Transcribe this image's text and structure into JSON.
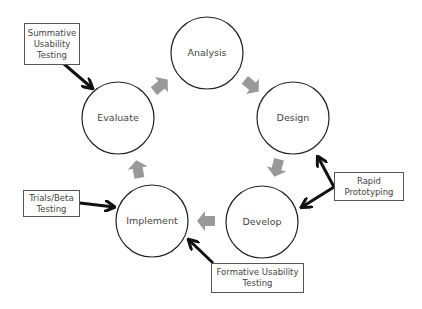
{
  "diagram": {
    "type": "cycle",
    "nodes": [
      {
        "id": "analysis",
        "label": "Analysis"
      },
      {
        "id": "design",
        "label": "Design"
      },
      {
        "id": "develop",
        "label": "Develop"
      },
      {
        "id": "implement",
        "label": "Implement"
      },
      {
        "id": "evaluate",
        "label": "Evaluate"
      }
    ],
    "cycle_order": [
      "Analysis",
      "Design",
      "Develop",
      "Implement",
      "Evaluate"
    ],
    "annotations": [
      {
        "id": "summative",
        "lines": [
          "Summative",
          "Usability",
          "Testing"
        ],
        "points_to": [
          "Evaluate"
        ]
      },
      {
        "id": "trials",
        "lines": [
          "Trials/Beta",
          "Testing"
        ],
        "points_to": [
          "Implement"
        ]
      },
      {
        "id": "rapid",
        "lines": [
          "Rapid",
          "Prototyping"
        ],
        "points_to": [
          "Design",
          "Develop"
        ]
      },
      {
        "id": "formative",
        "lines": [
          "Formative Usability",
          "Testing"
        ],
        "points_to": [
          "Implement"
        ]
      }
    ],
    "colors": {
      "circle_stroke": "#222222",
      "cycle_arrow": "#999999",
      "annotation_arrow": "#111111",
      "text": "#444444"
    }
  }
}
